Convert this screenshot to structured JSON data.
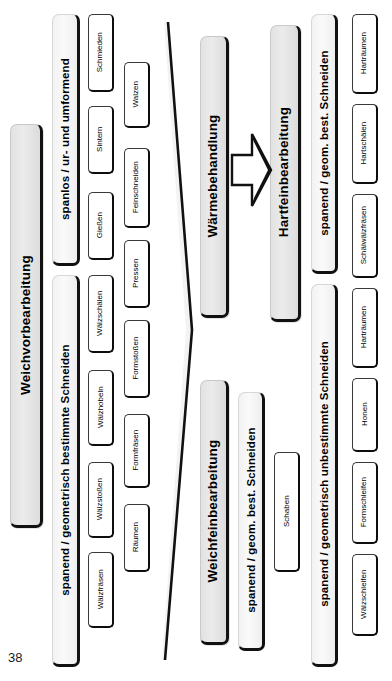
{
  "page": {
    "number": "38"
  },
  "diagram": {
    "title_implicit": "Fertigungsverfahren Zahnradbearbeitung",
    "arrow": {
      "name": "process-arrow",
      "direction": "right"
    },
    "stages": [
      {
        "id": "weichvorbearbeitung",
        "label": "Weichvorbearbeitung",
        "groups": [
          {
            "id": "spanlos-ur-und-umformend",
            "label": "spanlos / ur- und umformend",
            "items_col_a": [
              "Schmieden",
              "Sintern",
              "Gießen"
            ],
            "items_col_b": [
              "Walzen",
              "Feinschneiden",
              "Pressen"
            ]
          },
          {
            "id": "spanend-geometrisch-bestimmte-schneiden",
            "label": "spanend / geometrisch bestimmte Schneiden",
            "items_col_a": [
              "Wälzschälen",
              "Wälzhobeln",
              "Wälzstoßen",
              "Wälzfräsen"
            ],
            "items_col_b": [
              "Formstoßen",
              "Formfräsen",
              "Räumen"
            ]
          }
        ]
      },
      {
        "id": "waermebehandlung",
        "label": "Wärmebehandlung",
        "groups": []
      },
      {
        "id": "weichfeinbearbeitung",
        "label": "Weichfeinbearbeitung",
        "groups": [
          {
            "id": "spanend-geom-best-schneiden-weich",
            "label": "spanend / geom. best. Schneiden",
            "items_col_a": [
              "Schaben"
            ],
            "items_col_b": []
          }
        ]
      },
      {
        "id": "hartfeinbearbeitung",
        "label": "Hartfeinbearbeitung",
        "groups": [
          {
            "id": "spanend-geom-best-schneiden-hart",
            "label": "spanend / geom. best. Schneiden",
            "items_col_a": [
              "Harträumen",
              "Hartschälen",
              "Schälwälzfräsen"
            ],
            "items_col_b": []
          },
          {
            "id": "spanend-geometrisch-unbestimmte-schneiden",
            "label": "spanend / geometrisch unbestimmte Schneiden",
            "items_col_a": [
              "Harträumen",
              "Honen",
              "Formschleifen",
              "Wälzschleifen"
            ],
            "items_col_b": []
          }
        ]
      }
    ]
  },
  "colors": {
    "level1_fill": "#e6e6e6",
    "level2_fill": "#f4f4f4",
    "level3_fill": "#ffffff",
    "shadow": "#111111",
    "page_bg": "#ffffff"
  }
}
